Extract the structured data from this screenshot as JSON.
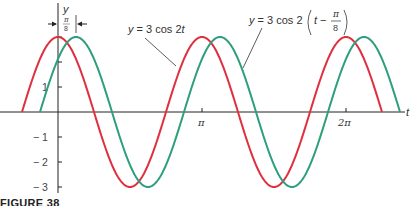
{
  "chart_data": {
    "type": "line",
    "title": "",
    "xlabel": "t",
    "ylabel": "y",
    "xlim": [
      -0.785,
      7.07
    ],
    "ylim": [
      -3,
      3
    ],
    "x_ticks": [
      "π",
      "2π"
    ],
    "y_ticks": [
      "1",
      "-1",
      "-2",
      "-3"
    ],
    "grid": false,
    "series": [
      {
        "name": "y = 3 cos 2t",
        "color": "#e0303f",
        "function": "3*cos(2*t)",
        "t_range": [
          "-π/4",
          "9π/4"
        ]
      },
      {
        "name": "y = 3 cos 2(t − π/8)",
        "color": "#2f9e7e",
        "function": "3*cos(2*(t-π/8))",
        "t_range": [
          "-π/8",
          "19π/8"
        ]
      }
    ],
    "annotations": [
      {
        "text": "π/8",
        "description": "phase shift between curves, marked with arrows near y-axis"
      },
      {
        "text": "y = 3 cos 2t",
        "target": "red curve"
      },
      {
        "text": "y = 3 cos 2(t − π/8)",
        "target": "green curve"
      }
    ]
  },
  "labels": {
    "y_axis": "y",
    "x_axis": "t",
    "tick_pi": "π",
    "tick_2pi": "2π",
    "tick_1": "1",
    "tick_m1": "− 1",
    "tick_m2": "− 2",
    "tick_m3": "− 3",
    "shift_num": "π",
    "shift_den": "8",
    "red_label": "y = 3 cos 2t",
    "green_label_prefix": "y = 3 cos 2",
    "green_label_inner": "t −",
    "green_frac_num": "π",
    "green_frac_den": "8"
  },
  "caption": "FIGURE 38"
}
